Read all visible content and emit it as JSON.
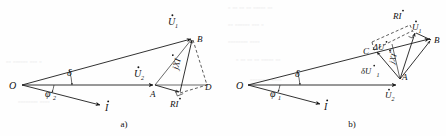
{
  "figure": {
    "background_color": "#fefefe",
    "ink_color": "#1b1b1b",
    "width": 446,
    "height": 136
  },
  "captions": {
    "a": "a)",
    "b": "b)"
  },
  "diagram_a": {
    "name": "phasor-diagram-a",
    "points": {
      "O": "O",
      "A": "A",
      "B": "B",
      "D": "D"
    },
    "vectors": {
      "u1": "U",
      "u1_sub": "1",
      "u2": "U",
      "u2_sub": "2",
      "current": "I",
      "ri": "RI",
      "jxi": "jXI"
    },
    "angles": {
      "delta": "δ",
      "phi": "φ",
      "phi_sub": "2"
    }
  },
  "diagram_b": {
    "name": "phasor-diagram-b",
    "points": {
      "O": "O",
      "A": "A",
      "B": "B",
      "C": "C"
    },
    "vectors": {
      "u1": "U",
      "u1_sub": "1",
      "u2": "U",
      "u2_sub": "2",
      "current": "I",
      "ri": "RI",
      "jxi": "jXI",
      "delta_u1": "ΔU",
      "delta_u1_sub": "1",
      "small_delta_u1": "δU",
      "small_delta_u1_sub": "1"
    },
    "angles": {
      "delta": "δ",
      "phi": "φ",
      "phi_sub": "1"
    }
  },
  "ghost_text": {
    "rows": [
      "▫ ▫▫ ▫▫  ▫▫ ▫▫▫▫▫ ▫▫",
      "▫▫ ▫▫▫▫▫▫ ▫▫▫ ▫",
      "▫▫▫▫▫▫▫▫ ▫▫▫▫"
    ]
  }
}
